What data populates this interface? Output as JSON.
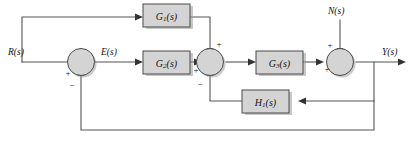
{
  "diagram": {
    "type": "control-system-block-diagram",
    "canvas": {
      "width": 412,
      "height": 145
    },
    "colors": {
      "block_fill": "#d4d4d4",
      "block_stroke": "#4a4a4a",
      "wire": "#555555",
      "background": "#ffffff",
      "text": "#111111"
    },
    "signals": {
      "input": {
        "name": "input-signal",
        "label": "R(s)"
      },
      "error": {
        "name": "error-signal",
        "label": "E(s)"
      },
      "disturbance": {
        "name": "disturbance-signal",
        "label": "N(s)"
      },
      "output": {
        "name": "output-signal",
        "label": "Y(s)"
      }
    },
    "blocks": [
      {
        "id": "g1",
        "name": "block-g1",
        "base": "G",
        "sub": "1",
        "arg": "(s)",
        "label": "G1(s)"
      },
      {
        "id": "g2",
        "name": "block-g2",
        "base": "G",
        "sub": "2",
        "arg": "(s)",
        "label": "G2(s)"
      },
      {
        "id": "g3",
        "name": "block-g3",
        "base": "G",
        "sub": "3",
        "arg": "(s)",
        "label": "G3(s)"
      },
      {
        "id": "h1",
        "name": "block-h1",
        "base": "H",
        "sub": "1",
        "arg": "(s)",
        "label": "H1(s)"
      }
    ],
    "summing_junctions": [
      {
        "id": "sum1",
        "name": "summing-junction-1",
        "signs": {
          "left": "+",
          "bottom": "−"
        }
      },
      {
        "id": "sum2",
        "name": "summing-junction-2",
        "signs": {
          "left": "+",
          "top": "+",
          "bottom": "−"
        }
      },
      {
        "id": "sum3",
        "name": "summing-junction-3",
        "signs": {
          "left": "+",
          "top": "+"
        }
      }
    ],
    "paths": [
      {
        "name": "path-input-to-sum1",
        "from": "R(s)",
        "to": "sum1"
      },
      {
        "name": "path-feedforward-g1",
        "from": "R(s) branch",
        "to": "sum2 top",
        "through": "G1(s)"
      },
      {
        "name": "path-sum1-to-g2",
        "from": "sum1",
        "to": "G2(s)",
        "carries": "E(s)"
      },
      {
        "name": "path-g2-to-sum2",
        "from": "G2(s)",
        "to": "sum2 left"
      },
      {
        "name": "path-sum2-to-g3",
        "from": "sum2",
        "to": "G3(s)"
      },
      {
        "name": "path-g3-to-sum3",
        "from": "G3(s)",
        "to": "sum3 left"
      },
      {
        "name": "path-disturbance-to-sum3",
        "from": "N(s)",
        "to": "sum3 top"
      },
      {
        "name": "path-sum3-to-output",
        "from": "sum3",
        "to": "Y(s)"
      },
      {
        "name": "path-inner-feedback-h1",
        "from": "Y(s) branch",
        "to": "sum2 bottom",
        "through": "H1(s)"
      },
      {
        "name": "path-outer-feedback",
        "from": "Y(s) branch",
        "to": "sum1 bottom"
      }
    ],
    "caption": {
      "name": "figure-caption",
      "text": ""
    }
  }
}
